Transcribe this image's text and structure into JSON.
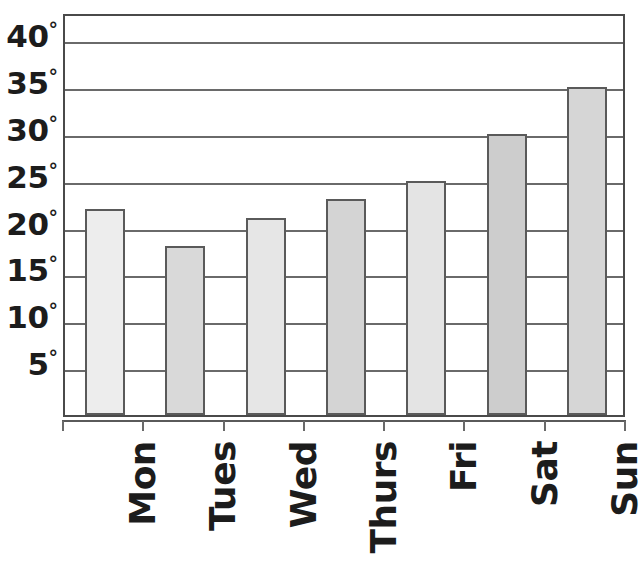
{
  "chart_data": {
    "type": "bar",
    "title": "",
    "subtitle": "",
    "xlabel": "",
    "ylabel": "",
    "categories": [
      "Mon",
      "Tues",
      "Wed",
      "Thurs",
      "Fri",
      "Sat",
      "Sun"
    ],
    "values": [
      22,
      18,
      21,
      23,
      25,
      30,
      35
    ],
    "unit": "°",
    "ylim": [
      0,
      43
    ],
    "y_ticks": [
      5,
      10,
      15,
      20,
      25,
      30,
      35,
      40
    ],
    "y_tick_labels": [
      "5°",
      "10°",
      "15°",
      "20°",
      "25°",
      "30°",
      "35°",
      "40°"
    ],
    "grid": "horizontal",
    "legend": "none",
    "bar_colors": [
      "#ededed",
      "#d9d9d9",
      "#e6e6e6",
      "#d4d4d4",
      "#e4e4e4",
      "#cdcdcd",
      "#d6d6d6"
    ],
    "bar_border_color": "#5a5a5a",
    "axis_color": "#4a4a4a",
    "grid_color": "#6a6a6a",
    "background": "#ffffff",
    "series": [
      {
        "name": "Temperature",
        "values": [
          22,
          18,
          21,
          23,
          25,
          30,
          35
        ]
      }
    ],
    "points": [
      {
        "category": "Mon",
        "value": 22,
        "label": "22°",
        "color": "#ededed"
      },
      {
        "category": "Tues",
        "value": 18,
        "label": "18°",
        "color": "#d9d9d9"
      },
      {
        "category": "Wed",
        "value": 21,
        "label": "21°",
        "color": "#e6e6e6"
      },
      {
        "category": "Thurs",
        "value": 23,
        "label": "23°",
        "color": "#d4d4d4"
      },
      {
        "category": "Fri",
        "value": 25,
        "label": "25°",
        "color": "#e4e4e4"
      },
      {
        "category": "Sat",
        "value": 30,
        "label": "30°",
        "color": "#cdcdcd"
      },
      {
        "category": "Sun",
        "value": 35,
        "label": "35°",
        "color": "#d6d6d6"
      }
    ]
  }
}
